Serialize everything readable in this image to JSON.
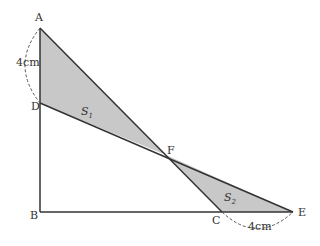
{
  "diagram": {
    "points": {
      "A": {
        "label": "A",
        "x": 40,
        "y": 28
      },
      "D": {
        "label": "D",
        "x": 40,
        "y": 103
      },
      "B": {
        "label": "B",
        "x": 40,
        "y": 212
      },
      "C": {
        "label": "C",
        "x": 222,
        "y": 212
      },
      "E": {
        "label": "E",
        "x": 293,
        "y": 212
      },
      "F": {
        "label": "F",
        "x": 166,
        "y": 155
      }
    },
    "regions": {
      "S1": {
        "main": "S",
        "sub": "1"
      },
      "S2": {
        "main": "S",
        "sub": "2"
      }
    },
    "measurements": {
      "AD": "4cm",
      "CE": "4cm"
    },
    "colors": {
      "shade": "#c8c8c8",
      "line": "#333333",
      "dash": "#555555"
    }
  }
}
